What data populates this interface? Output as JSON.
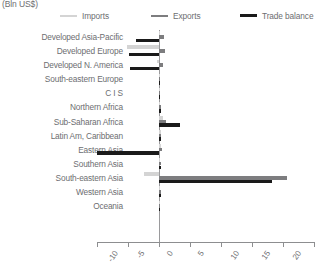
{
  "unit_title": "(Bln US$)",
  "legend": [
    {
      "label": "Imports",
      "color": "#d4d4d4",
      "thick": false,
      "icon": "line-swatch-icon"
    },
    {
      "label": "Exports",
      "color": "#7d7d7f",
      "thick": false,
      "icon": "line-swatch-icon"
    },
    {
      "label": "Trade balance",
      "color": "#1a1a1a",
      "thick": true,
      "icon": "line-swatch-icon"
    }
  ],
  "chart_data": {
    "type": "bar",
    "orientation": "horizontal",
    "title": "",
    "subtitle": "",
    "xlabel": "",
    "ylabel": "",
    "unit": "(Bln US$)",
    "xlim": [
      -10,
      25
    ],
    "xticks": [
      -10,
      -5,
      0,
      5,
      10,
      15,
      20,
      25
    ],
    "xtick_labels": [
      "-10",
      "-5",
      "0",
      "5",
      "10",
      "15",
      "20",
      "25"
    ],
    "grid": false,
    "legend_position": "top",
    "categories": [
      "Developed Asia-Pacific",
      "Developed Europe",
      "Developed N. America",
      "South-eastern Europe",
      "C I S",
      "Northern Africa",
      "Sub-Saharan Africa",
      "Latin Am, Caribbean",
      "Eastern Asia",
      "Southern Asia",
      "South-eastern Asia",
      "Western Asia",
      "Oceania"
    ],
    "series": [
      {
        "name": "Imports",
        "color": "#d4d4d4",
        "values": [
          0.2,
          -5.1,
          -0.4,
          0.2,
          0.1,
          0.2,
          0.6,
          0.3,
          0.3,
          0.2,
          -2.4,
          0.2,
          0.05
        ]
      },
      {
        "name": "Exports",
        "color": "#7d7d7f",
        "values": [
          0.8,
          1.0,
          0.7,
          0.2,
          0.2,
          0.3,
          1.1,
          0.4,
          0.5,
          0.4,
          20.6,
          0.3,
          0.05
        ]
      },
      {
        "name": "Trade balance",
        "color": "#1a1a1a",
        "values": [
          -3.7,
          -4.8,
          -4.6,
          0.2,
          0.2,
          0.3,
          3.4,
          0.3,
          -10.0,
          0.4,
          18.2,
          0.3,
          0.05
        ]
      }
    ]
  }
}
